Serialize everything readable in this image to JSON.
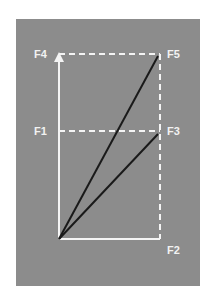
{
  "diagram": {
    "background_color": "#8c8c8c",
    "labels": {
      "f1": "F1",
      "f2": "F2",
      "f3": "F3",
      "f4": "F4",
      "f5": "F5"
    },
    "vectors": [
      {
        "name": "F4",
        "from": [
          59,
          239
        ],
        "to": [
          59,
          54
        ],
        "style": "solid-white-arrow"
      },
      {
        "name": "F2",
        "from": [
          59,
          239
        ],
        "to": [
          160,
          239
        ],
        "style": "solid-white"
      },
      {
        "name": "F5",
        "from": [
          59,
          239
        ],
        "to": [
          158,
          56
        ],
        "style": "solid-black"
      },
      {
        "name": "F3",
        "from": [
          59,
          239
        ],
        "to": [
          158,
          134
        ],
        "style": "solid-black"
      }
    ],
    "guides": [
      {
        "from": [
          59,
          54
        ],
        "to": [
          160,
          54
        ],
        "style": "dashed-white"
      },
      {
        "from": [
          160,
          54
        ],
        "to": [
          160,
          239
        ],
        "style": "dashed-white"
      },
      {
        "from": [
          59,
          131
        ],
        "to": [
          160,
          131
        ],
        "style": "dashed-white"
      }
    ]
  }
}
